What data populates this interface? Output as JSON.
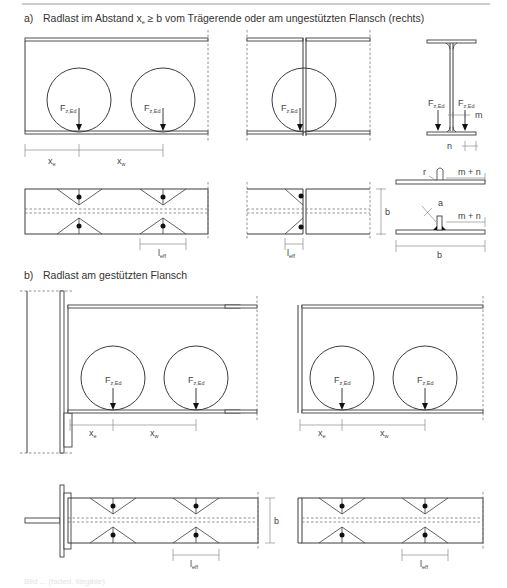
{
  "figure": {
    "section_a": {
      "label": "a)",
      "title_pre": "Radlast im Abstand x",
      "title_sub": "e",
      "title_post": " ≥ b vom Trägerende oder am ungestützten Flansch (rechts)"
    },
    "section_b": {
      "label": "b)",
      "title": "Radlast am gestützten Flansch"
    },
    "labels": {
      "force_main": "F",
      "force_sub": "z,Ed",
      "xe_main": "x",
      "xe_sub": "e",
      "xw_main": "x",
      "xw_sub": "w",
      "leff_main": "l",
      "leff_sub": "eff",
      "b": "b",
      "m": "m",
      "n": "n",
      "m_plus_n": "m + n",
      "r": "r",
      "a": "a"
    },
    "footer_caption": "Bild ... (faded, illegible)"
  },
  "colors": {
    "line": "#3c3c3c",
    "dash": "#777777",
    "text": "#444444",
    "background": "#ffffff"
  }
}
